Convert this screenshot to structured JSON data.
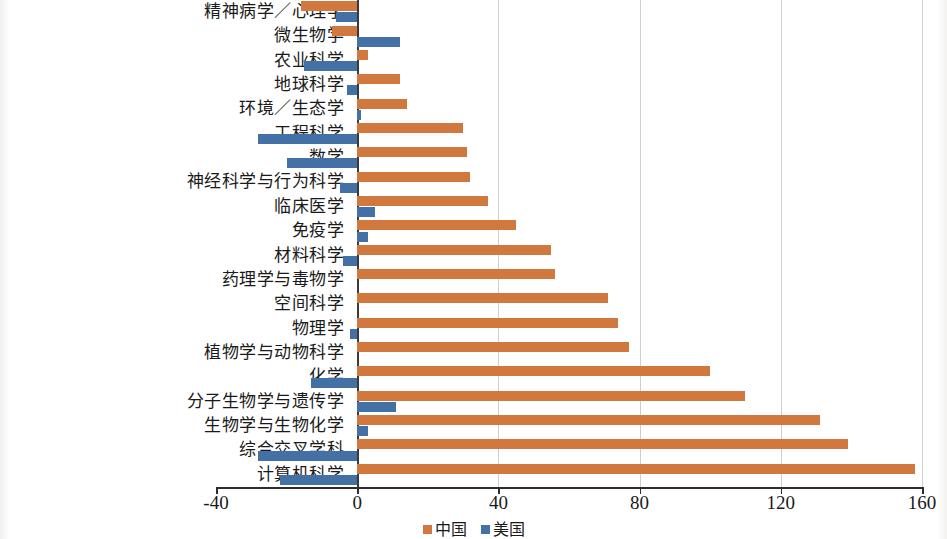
{
  "chart_data": {
    "type": "bar",
    "orientation": "horizontal",
    "title": "",
    "subtitle": "",
    "xlabel": "",
    "ylabel": "",
    "xlim": [
      -40,
      160
    ],
    "xticks": [
      -40,
      0,
      40,
      80,
      120,
      160
    ],
    "xtick_labels": [
      "-40",
      "0",
      "40",
      "80",
      "120",
      "160"
    ],
    "grid": true,
    "grid_axis": "x",
    "legend_position": "bottom-center",
    "colors": {
      "china": "#d1783f",
      "usa": "#4371a5",
      "gridline": "#cfcfcf",
      "axis": "#2d2d2d",
      "zero_line": "#3a3a3a",
      "text": "#1a1a1a",
      "background": "#ffffff"
    },
    "categories": [
      "精神病学／心理学",
      "微生物学",
      "农业科学",
      "地球科学",
      "环境／生态学",
      "工程科学",
      "数学",
      "神经科学与行为科学",
      "临床医学",
      "免疫学",
      "材料科学",
      "药理学与毒物学",
      "空间科学",
      "物理学",
      "植物学与动物科学",
      "化学",
      "分子生物学与遗传学",
      "生物学与生物化学",
      "综合交叉学科",
      "计算机科学"
    ],
    "series": [
      {
        "name": "中国",
        "color": "#d1783f",
        "values": [
          -16,
          -7,
          3,
          12,
          14,
          30,
          31,
          32,
          37,
          45,
          55,
          56,
          71,
          74,
          77,
          100,
          110,
          131,
          139,
          158
        ]
      },
      {
        "name": "美国",
        "color": "#4371a5",
        "values": [
          -6,
          12,
          -15,
          -3,
          1,
          -28,
          -20,
          -5,
          5,
          3,
          -4,
          0,
          0,
          -2,
          0,
          -13,
          11,
          3,
          -28,
          -22
        ]
      }
    ],
    "legend": [
      {
        "label": "中国",
        "color": "#d1783f"
      },
      {
        "label": "美国",
        "color": "#4371a5"
      }
    ]
  }
}
